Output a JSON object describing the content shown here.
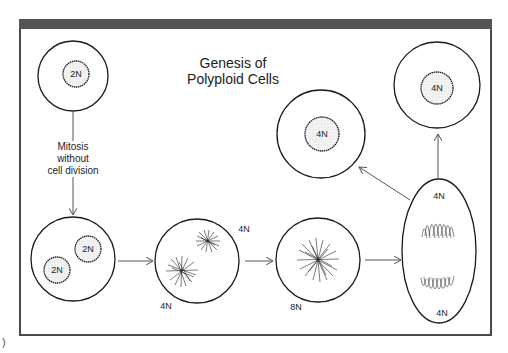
{
  "figure": {
    "title_line1": "Genesis of",
    "title_line2": "Polyploid Cells",
    "fragment_left": ")",
    "colors": {
      "frame": "#4a4a4a",
      "header_bar": "#555555",
      "line": "#1a1a1a",
      "arrow": "#555555",
      "nucleus_fill": "#f2f2f2"
    }
  },
  "annotation": {
    "line1": "Mitosis",
    "line2": "without",
    "line3": "cell division"
  },
  "cells": [
    {
      "id": "diploid-cell",
      "nuclei": [
        "2N"
      ]
    },
    {
      "id": "binucleate-cell",
      "nuclei": [
        "2N",
        "2N"
      ]
    },
    {
      "id": "prophase-cell",
      "labels": [
        "4N",
        "4N"
      ]
    },
    {
      "id": "metaphase-cell",
      "labels": [
        "8N"
      ]
    },
    {
      "id": "anaphase-cell",
      "labels": [
        "4N",
        "4N"
      ]
    },
    {
      "id": "daughter-cell-left",
      "nuclei": [
        "4N"
      ]
    },
    {
      "id": "daughter-cell-right",
      "nuclei": [
        "4N"
      ]
    }
  ]
}
